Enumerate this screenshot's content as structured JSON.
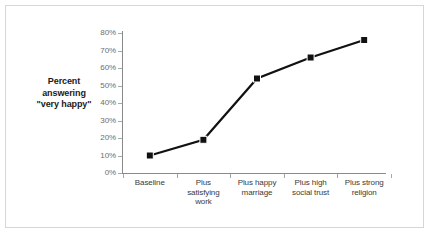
{
  "chart_data": {
    "type": "line",
    "title": "",
    "subtitle": "",
    "xlabel": "",
    "ylabel": "Percent answering \"very happy\"",
    "ylabel_lines": [
      "Percent",
      "answering",
      "\"very happy\""
    ],
    "categories": [
      "Baseline",
      "Plus satisfying work",
      "Plus happy marriage",
      "Plus high social trust",
      "Plus strong religion"
    ],
    "category_lines": [
      [
        "Baseline"
      ],
      [
        "Plus",
        "satisfying",
        "work"
      ],
      [
        "Plus happy",
        "marriage"
      ],
      [
        "Plus high",
        "social trust"
      ],
      [
        "Plus strong",
        "religion"
      ]
    ],
    "values": [
      10,
      19,
      54,
      66,
      76
    ],
    "value_labels": [
      "10%",
      "19%",
      "54%",
      "66%",
      "76%"
    ],
    "ylim": [
      0,
      80
    ],
    "ytick_values": [
      0,
      10,
      20,
      30,
      40,
      50,
      60,
      70,
      80
    ],
    "ytick_labels": [
      "0%",
      "10%",
      "20%",
      "30%",
      "40%",
      "50%",
      "60%",
      "70%",
      "80%"
    ],
    "grid": false,
    "legend": "none",
    "series": [
      {
        "name": "Percent answering \"very happy\"",
        "values": [
          10,
          19,
          54,
          66,
          76
        ],
        "line_color": "#111111",
        "marker": "square",
        "marker_color": "#111111"
      }
    ],
    "colors": {
      "line": "#111111",
      "marker": "#111111",
      "axis": "#8a8a8a",
      "ytick_text": "#6e6e6e",
      "xtick_text": "#3a3a3a",
      "axis_title_text": "#1a1a1a",
      "frame_border": "#d6d6d6",
      "background": "#ffffff"
    }
  }
}
